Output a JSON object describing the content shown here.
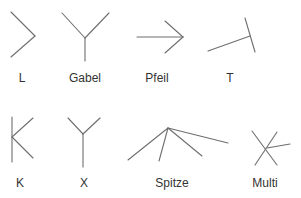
{
  "diagram": {
    "title": "",
    "stroke_color": "#6e6e6e",
    "label_color": "#333333",
    "junctions": [
      {
        "id": "L",
        "label": "L",
        "label_pos": [
          22,
          82
        ],
        "lines": [
          [
            11,
            12,
            35,
            36
          ],
          [
            35,
            36,
            11,
            57
          ]
        ]
      },
      {
        "id": "Gabel",
        "label": "Gabel",
        "label_pos": [
          85,
          82
        ],
        "lines": [
          [
            62,
            13,
            85,
            38
          ],
          [
            109,
            13,
            85,
            38
          ],
          [
            85,
            38,
            85,
            61
          ]
        ]
      },
      {
        "id": "Pfeil",
        "label": "Pfeil",
        "label_pos": [
          157,
          82
        ],
        "lines": [
          [
            137,
            37,
            183,
            37
          ],
          [
            165,
            21,
            183,
            37
          ],
          [
            183,
            37,
            165,
            53
          ]
        ]
      },
      {
        "id": "T",
        "label": "T",
        "label_pos": [
          230,
          82
        ],
        "lines": [
          [
            245,
            18,
            255,
            52
          ],
          [
            208,
            51,
            250,
            36
          ]
        ]
      },
      {
        "id": "K",
        "label": "K",
        "label_pos": [
          20,
          187
        ],
        "lines": [
          [
            12,
            117,
            12,
            162
          ],
          [
            12,
            137,
            33,
            118
          ],
          [
            12,
            137,
            33,
            158
          ]
        ]
      },
      {
        "id": "X",
        "label": "X",
        "label_pos": [
          84,
          187
        ],
        "lines": [
          [
            83,
            134,
            83,
            167
          ],
          [
            68,
            118,
            83,
            134
          ],
          [
            100,
            118,
            83,
            134
          ]
        ]
      },
      {
        "id": "Spitze",
        "label": "Spitze",
        "label_pos": [
          172,
          187
        ],
        "lines": [
          [
            168,
            128,
            128,
            160
          ],
          [
            168,
            128,
            159,
            161
          ],
          [
            168,
            128,
            202,
            156
          ],
          [
            168,
            128,
            228,
            143
          ]
        ]
      },
      {
        "id": "Multi",
        "label": "Multi",
        "label_pos": [
          265,
          187
        ],
        "lines": [
          [
            252,
            131,
            277,
            165
          ],
          [
            277,
            132,
            255,
            165
          ],
          [
            267,
            148,
            290,
            144
          ]
        ]
      }
    ]
  }
}
